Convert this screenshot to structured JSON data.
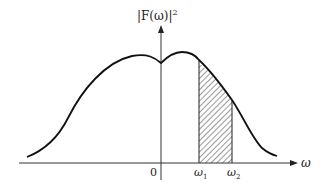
{
  "diagram": {
    "y_axis_label": "|F(ω)|",
    "y_axis_label_exponent": "2",
    "x_axis_label": "ω",
    "origin_label": "0",
    "band_start_label": "ω",
    "band_start_sub": "1",
    "band_end_label": "ω",
    "band_end_sub": "2",
    "colors": {
      "line": "#111111",
      "hatch": "#333333",
      "background": "#ffffff"
    }
  }
}
